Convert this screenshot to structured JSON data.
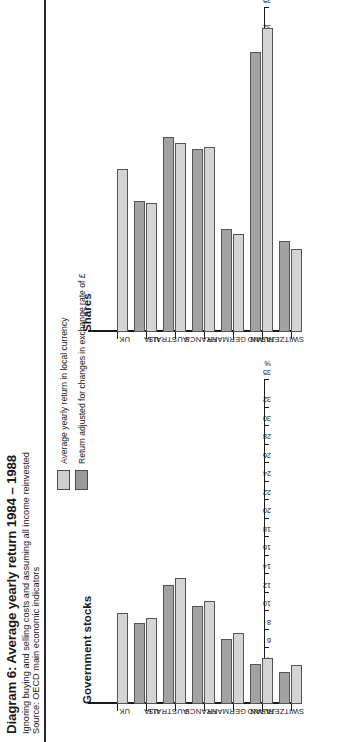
{
  "header": {
    "title": "Diagram 6: Average yearly return 1984 – 1988",
    "subtitle": "Ignoring buying and selling costs and assuming all income reinvested",
    "source": "Source: OECD main economic indicators"
  },
  "legend": {
    "items": [
      {
        "label": "Average yearly return in local currency",
        "color": "#d4d4d4",
        "key": "local"
      },
      {
        "label": "Return adjusted for changes in exchange rate of £",
        "color": "#a2a2a2",
        "key": "adjusted"
      }
    ]
  },
  "axis": {
    "unit_label": "%",
    "ticks": [
      0,
      2,
      4,
      6,
      8,
      10,
      12,
      14,
      16,
      18,
      20,
      22,
      24,
      26,
      28,
      30,
      32,
      35
    ],
    "min": 0,
    "max": 35
  },
  "chart_data": [
    {
      "type": "bar",
      "title": "Government stocks",
      "orientation": "horizontal",
      "categories": [
        "UK",
        "US",
        "AUSTRALIA",
        "FRANCE",
        "GERMANY",
        "JAPAN",
        "SWITZERLAND"
      ],
      "xlabel": "%",
      "ylabel": "",
      "xlim": [
        0,
        35
      ],
      "grid": false,
      "legend_position": "top-right",
      "series": [
        {
          "name": "Average yearly return in local currency",
          "color": "#d4d4d4",
          "values": [
            9.8,
            9.3,
            13.6,
            11.1,
            7.7,
            5.0,
            4.2
          ]
        },
        {
          "name": "Return adjusted for changes in exchange rate of £",
          "color": "#a2a2a2",
          "values": [
            null,
            8.7,
            12.9,
            10.6,
            7.0,
            4.3,
            3.5
          ]
        }
      ]
    },
    {
      "type": "bar",
      "title": "Shares",
      "orientation": "horizontal",
      "categories": [
        "UK",
        "US",
        "AUSTRALIA",
        "FRANCE",
        "GERMANY",
        "JAPAN",
        "SWITZERLAND"
      ],
      "xlabel": "%",
      "ylabel": "",
      "xlim": [
        0,
        35
      ],
      "grid": false,
      "legend_position": "top-right",
      "series": [
        {
          "name": "Average yearly return in local currency",
          "color": "#d4d4d4",
          "values": [
            17.6,
            13.9,
            20.4,
            20.0,
            10.6,
            32.8,
            9.0
          ]
        },
        {
          "name": "Return adjusted for changes in exchange rate of £",
          "color": "#a2a2a2",
          "values": [
            null,
            14.1,
            21.1,
            19.8,
            11.1,
            30.3,
            9.8
          ]
        }
      ]
    }
  ]
}
